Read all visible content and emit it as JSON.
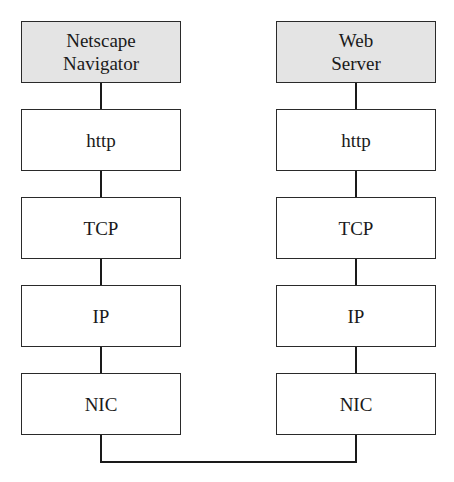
{
  "diagram": {
    "type": "protocol-stack",
    "left_stack": {
      "layers": [
        "Netscape\nNavigator",
        "http",
        "TCP",
        "IP",
        "NIC"
      ],
      "top_line1": "Netscape",
      "top_line2": "Navigator"
    },
    "right_stack": {
      "layers": [
        "Web\nServer",
        "http",
        "TCP",
        "IP",
        "NIC"
      ],
      "top_line1": "Web",
      "top_line2": "Server"
    },
    "labels": {
      "http": "http",
      "tcp": "TCP",
      "ip": "IP",
      "nic": "NIC"
    },
    "colors": {
      "application_fill": "#e4e4e4",
      "layer_fill": "#ffffff",
      "line": "#1a1a1a"
    },
    "connection": "NIC-to-NIC physical link"
  }
}
